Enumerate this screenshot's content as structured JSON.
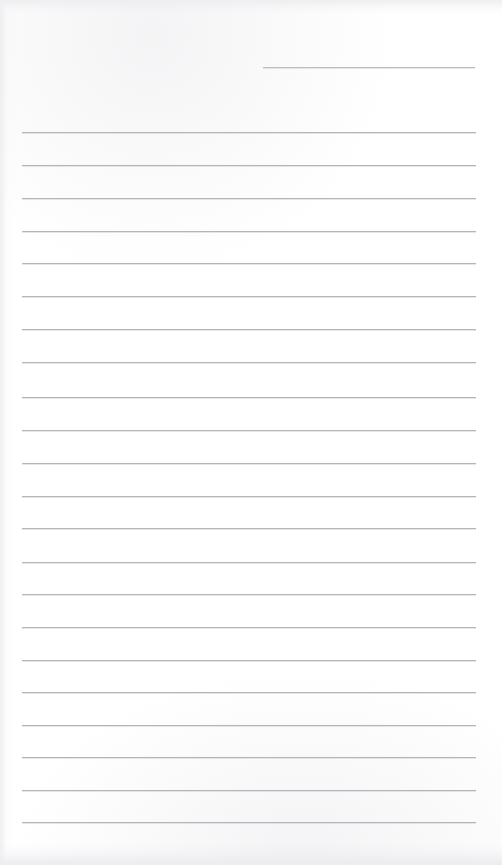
{
  "document": {
    "type": "lined-form-page",
    "title": "Blank Lined Form Page",
    "page_width": 502,
    "page_height": 865,
    "background_color": "#ffffff",
    "rule_color": "#b6b6bb",
    "rule_thickness_px": 1,
    "content_text": "",
    "header": {
      "short_rule": {
        "name": "header-entry-line",
        "value": "",
        "placeholder": "",
        "x": 263,
        "y": 67,
        "width": 212
      }
    },
    "body": {
      "left_margin_x": 22,
      "right_margin_x": 476,
      "line_width": 454,
      "first_line_y": 132,
      "line_spacing_px": 32.85,
      "line_count": 22,
      "lines": [
        {
          "index": 1,
          "y": 132,
          "value": ""
        },
        {
          "index": 2,
          "y": 165,
          "value": ""
        },
        {
          "index": 3,
          "y": 198,
          "value": ""
        },
        {
          "index": 4,
          "y": 231,
          "value": ""
        },
        {
          "index": 5,
          "y": 263,
          "value": ""
        },
        {
          "index": 6,
          "y": 296,
          "value": ""
        },
        {
          "index": 7,
          "y": 329,
          "value": ""
        },
        {
          "index": 8,
          "y": 362,
          "value": ""
        },
        {
          "index": 9,
          "y": 397,
          "value": ""
        },
        {
          "index": 10,
          "y": 430,
          "value": ""
        },
        {
          "index": 11,
          "y": 463,
          "value": ""
        },
        {
          "index": 12,
          "y": 496,
          "value": ""
        },
        {
          "index": 13,
          "y": 528,
          "value": ""
        },
        {
          "index": 14,
          "y": 562,
          "value": ""
        },
        {
          "index": 15,
          "y": 594,
          "value": ""
        },
        {
          "index": 16,
          "y": 627,
          "value": ""
        },
        {
          "index": 17,
          "y": 660,
          "value": ""
        },
        {
          "index": 18,
          "y": 692,
          "value": ""
        },
        {
          "index": 19,
          "y": 725,
          "value": ""
        },
        {
          "index": 20,
          "y": 757,
          "value": ""
        },
        {
          "index": 21,
          "y": 790,
          "value": ""
        },
        {
          "index": 22,
          "y": 822,
          "value": ""
        }
      ]
    }
  }
}
